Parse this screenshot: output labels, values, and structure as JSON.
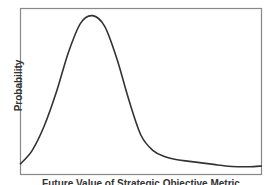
{
  "chart_data": {
    "type": "line",
    "title": "",
    "xlabel": "Future Value of Strategic Objective Metric",
    "ylabel": "Probability",
    "grid": false,
    "legend": null,
    "x": [
      0,
      5,
      10,
      15,
      20,
      25,
      30,
      35,
      40,
      45,
      50,
      55,
      60,
      65,
      70,
      75,
      80,
      85,
      90,
      95,
      100
    ],
    "values": [
      0.03,
      0.12,
      0.28,
      0.5,
      0.76,
      0.95,
      1.0,
      0.93,
      0.72,
      0.45,
      0.22,
      0.12,
      0.08,
      0.06,
      0.05,
      0.04,
      0.03,
      0.02,
      0.015,
      0.015,
      0.02
    ],
    "series": [
      {
        "name": "distribution",
        "color": "#333333"
      }
    ],
    "frame": {
      "left": 20,
      "top": 8,
      "right": 262,
      "bottom": 175
    },
    "ylim": [
      0,
      1.05
    ]
  }
}
